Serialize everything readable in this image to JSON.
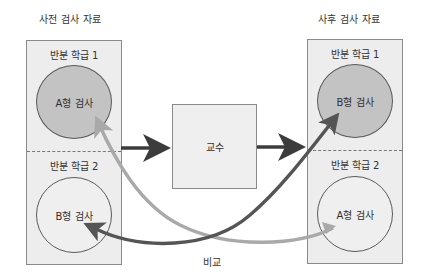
{
  "diagram": {
    "pre_test": {
      "title": "사전 검사 자료",
      "groups": [
        {
          "label": "반분 학급 1",
          "test": "A형 검사",
          "style": "filled"
        },
        {
          "label": "반분 학급 2",
          "test": "B형 검사",
          "style": "outline"
        }
      ]
    },
    "instruction": {
      "label": "교수"
    },
    "post_test": {
      "title": "사후 검사 자료",
      "groups": [
        {
          "label": "반분 학급 1",
          "test": "B형 검사",
          "style": "filled"
        },
        {
          "label": "반분 학급 2",
          "test": "A형 검사",
          "style": "outline"
        }
      ]
    },
    "comparison": {
      "label": "비교"
    },
    "colors": {
      "panel_fill": "#ededed",
      "panel_border": "#8a8a8a",
      "filled_circle": "#c3c3c3",
      "dark_arrow": "#4a4a4a",
      "light_arrow": "#a9a9a9",
      "straight_arrow": "#3c3c3c"
    }
  }
}
